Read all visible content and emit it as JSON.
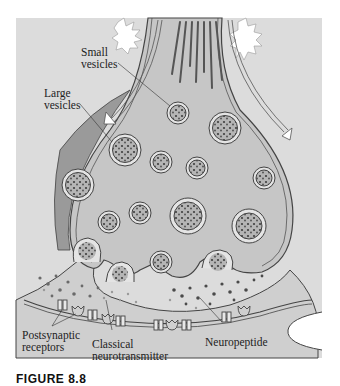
{
  "figure": {
    "type": "synapse-diagram",
    "colors": {
      "panel_bg": "#dcdcdc",
      "terminal_fill": "#c6c6c6",
      "terminal_dark_band": "#9a9a9a",
      "postsynaptic_fill": "#cfcfcf",
      "outline": "#444444",
      "vesicle_core": "#b5b5b5",
      "granule": "#3e3e3e",
      "neurotransmitter_dot": "#8a8a8a"
    },
    "labels": {
      "small_vesicles": "Small\nvesicles",
      "large_vesicles": "Large\nvesicles",
      "postsynaptic_receptors": "Postsynaptic\nreceptors",
      "classical_neurotransmitter": "Classical\nneurotransmitter",
      "neuropeptide": "Neuropeptide"
    },
    "caption": "FIGURE 8.8"
  }
}
